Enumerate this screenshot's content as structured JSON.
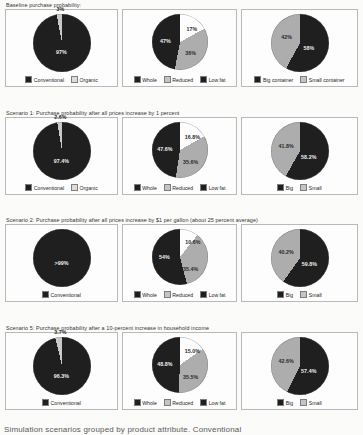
{
  "document": {
    "footer_partial_text": "Simulation scenarios grouped by product attribute. Conventional"
  },
  "palette": {
    "dark": "#1f1f1f",
    "light": "#adadad",
    "mid": "#3a3a3a",
    "panel_border": "#b9b9b9",
    "page_background": "#fbfbfa"
  },
  "sections": [
    {
      "id": "baseline",
      "title": "Baseline purchase probability:",
      "charts": [
        {
          "name": "organic-vs-conventional",
          "type": "pie",
          "size": 58,
          "slices": [
            {
              "label": "Conventional",
              "value": 97,
              "display": "97%",
              "color": "#1f1f1f",
              "label_pos": "inside",
              "label_x": 50,
              "label_y": 66,
              "label_tone": "on-dark"
            },
            {
              "label": "Organic",
              "value": 3,
              "display": "3%",
              "color": "#c9c9c9",
              "label_pos": "outside",
              "label_x": 48,
              "label_y": -9,
              "label_tone": "outside"
            }
          ],
          "legend": [
            {
              "label": "Conventional",
              "color": "#1f1f1f"
            },
            {
              "label": "Organic",
              "color": "#dcdcdc"
            }
          ]
        },
        {
          "name": "milk-fat-level",
          "type": "pie",
          "size": 56,
          "slices": [
            {
              "label": "Low fat",
              "value": 17,
              "display": "17%",
              "color": "#fdfdfd",
              "label_pos": "inside",
              "label_x": 72,
              "label_y": 26,
              "label_tone": "on-light"
            },
            {
              "label": "Reduced",
              "value": 36,
              "display": "36%",
              "color": "#adadad",
              "label_pos": "inside",
              "label_x": 70,
              "label_y": 70,
              "label_tone": "on-light"
            },
            {
              "label": "Whole",
              "value": 47,
              "display": "47%",
              "color": "#1f1f1f",
              "label_pos": "inside",
              "label_x": 25,
              "label_y": 48,
              "label_tone": "on-dark"
            }
          ],
          "legend": [
            {
              "label": "Whole",
              "color": "#1f1f1f"
            },
            {
              "label": "Reduced",
              "color": "#c4c4c4"
            },
            {
              "label": "Low fat",
              "color": "#1f1f1f"
            }
          ]
        },
        {
          "name": "container-size",
          "type": "pie",
          "size": 58,
          "slices": [
            {
              "label": "Big container",
              "value": 58,
              "display": "58%",
              "color": "#1f1f1f",
              "label_pos": "inside",
              "label_x": 66,
              "label_y": 58,
              "label_tone": "on-dark"
            },
            {
              "label": "Small container",
              "value": 42,
              "display": "42%",
              "color": "#adadad",
              "label_pos": "inside",
              "label_x": 28,
              "label_y": 40,
              "label_tone": "on-light"
            }
          ],
          "legend": [
            {
              "label": "Big container",
              "color": "#1f1f1f"
            },
            {
              "label": "Small container",
              "color": "#c4c4c4"
            }
          ]
        }
      ]
    },
    {
      "id": "scenario-1",
      "title": "Scenario 1: Purchase probability after all prices increase by 1 percent",
      "charts": [
        {
          "name": "organic-vs-conventional",
          "type": "pie",
          "size": 58,
          "slices": [
            {
              "label": "Conventional",
              "value": 97.4,
              "display": "97.4%",
              "color": "#1f1f1f",
              "label_pos": "inside",
              "label_x": 50,
              "label_y": 68,
              "label_tone": "on-dark"
            },
            {
              "label": "Organic",
              "value": 2.6,
              "display": "2.6%",
              "color": "#c9c9c9",
              "label_pos": "outside",
              "label_x": 48,
              "label_y": -9,
              "label_tone": "outside"
            }
          ],
          "legend": [
            {
              "label": "Conventional",
              "color": "#1f1f1f"
            },
            {
              "label": "Organic",
              "color": "#dcdcdc"
            }
          ]
        },
        {
          "name": "milk-fat-level",
          "type": "pie",
          "size": 56,
          "slices": [
            {
              "label": "Low fat",
              "value": 16.8,
              "display": "16.8%",
              "color": "#fdfdfd",
              "label_pos": "inside",
              "label_x": 73,
              "label_y": 27,
              "label_tone": "on-light"
            },
            {
              "label": "Reduced",
              "value": 35.6,
              "display": "35.6%",
              "color": "#adadad",
              "label_pos": "inside",
              "label_x": 70,
              "label_y": 71,
              "label_tone": "on-light"
            },
            {
              "label": "Whole",
              "value": 47.6,
              "display": "47.6%",
              "color": "#1f1f1f",
              "label_pos": "inside",
              "label_x": 24,
              "label_y": 49,
              "label_tone": "on-dark"
            }
          ],
          "legend": [
            {
              "label": "Whole",
              "color": "#1f1f1f"
            },
            {
              "label": "Reduced",
              "color": "#c4c4c4"
            },
            {
              "label": "Low fat",
              "color": "#1f1f1f"
            }
          ]
        },
        {
          "name": "container-size",
          "type": "pie",
          "size": 58,
          "slices": [
            {
              "label": "Big",
              "value": 58.2,
              "display": "58.2%",
              "color": "#1f1f1f",
              "label_pos": "inside",
              "label_x": 66,
              "label_y": 60,
              "label_tone": "on-dark"
            },
            {
              "label": "Small",
              "value": 41.8,
              "display": "41.8%",
              "color": "#adadad",
              "label_pos": "inside",
              "label_x": 27,
              "label_y": 41,
              "label_tone": "on-light"
            }
          ],
          "legend": [
            {
              "label": "Big",
              "color": "#1f1f1f"
            },
            {
              "label": "Small",
              "color": "#c4c4c4"
            }
          ]
        }
      ]
    },
    {
      "id": "scenario-2",
      "title": "Scenario 2: Purchase probability after all prices increase by $1 per gallon (about 25 percent average)",
      "charts": [
        {
          "name": "organic-vs-conventional",
          "type": "pie",
          "size": 58,
          "slices": [
            {
              "label": "Conventional",
              "value": 99.6,
              "display": ">99%",
              "color": "#1f1f1f",
              "label_pos": "inside",
              "label_x": 50,
              "label_y": 58,
              "label_tone": "on-dark"
            }
          ],
          "legend": [
            {
              "label": "Conventional",
              "color": "#1f1f1f"
            }
          ]
        },
        {
          "name": "milk-fat-level",
          "type": "pie",
          "size": 56,
          "slices": [
            {
              "label": "Low fat",
              "value": 10.6,
              "display": "10.6%",
              "color": "#fdfdfd",
              "label_pos": "inside",
              "label_x": 74,
              "label_y": 24,
              "label_tone": "on-light"
            },
            {
              "label": "Reduced",
              "value": 35.4,
              "display": "35.4%",
              "color": "#adadad",
              "label_pos": "inside",
              "label_x": 70,
              "label_y": 72,
              "label_tone": "on-light"
            },
            {
              "label": "Whole",
              "value": 54.0,
              "display": "54%",
              "color": "#1f1f1f",
              "label_pos": "inside",
              "label_x": 23,
              "label_y": 50,
              "label_tone": "on-dark"
            }
          ],
          "legend": [
            {
              "label": "Whole",
              "color": "#1f1f1f"
            },
            {
              "label": "Reduced",
              "color": "#c4c4c4"
            },
            {
              "label": "Low fat",
              "color": "#1f1f1f"
            }
          ]
        },
        {
          "name": "container-size",
          "type": "pie",
          "size": 58,
          "slices": [
            {
              "label": "Big",
              "value": 59.8,
              "display": "59.8%",
              "color": "#1f1f1f",
              "label_pos": "inside",
              "label_x": 67,
              "label_y": 61,
              "label_tone": "on-dark"
            },
            {
              "label": "Small",
              "value": 40.2,
              "display": "40.2%",
              "color": "#adadad",
              "label_pos": "inside",
              "label_x": 27,
              "label_y": 40,
              "label_tone": "on-light"
            }
          ],
          "legend": [
            {
              "label": "Big",
              "color": "#1f1f1f"
            },
            {
              "label": "Small",
              "color": "#c4c4c4"
            }
          ]
        }
      ]
    },
    {
      "id": "scenario-5",
      "title": "Scenario 5: Purchase probability after a 10-percent increase in household income",
      "charts": [
        {
          "name": "organic-vs-conventional",
          "type": "pie",
          "size": 58,
          "slices": [
            {
              "label": "Conventional",
              "value": 96.3,
              "display": "96.3%",
              "color": "#1f1f1f",
              "label_pos": "inside",
              "label_x": 50,
              "label_y": 68,
              "label_tone": "on-dark"
            },
            {
              "label": "Organic",
              "value": 3.7,
              "display": "3.7%",
              "color": "#c9c9c9",
              "label_pos": "outside",
              "label_x": 48,
              "label_y": -9,
              "label_tone": "outside"
            }
          ],
          "legend": [
            {
              "label": "Conventional",
              "color": "#1f1f1f"
            }
          ]
        },
        {
          "name": "milk-fat-level",
          "type": "pie",
          "size": 56,
          "slices": [
            {
              "label": "Low fat",
              "value": 15.0,
              "display": "15.0%",
              "color": "#fdfdfd",
              "label_pos": "inside",
              "label_x": 73,
              "label_y": 25,
              "label_tone": "on-light"
            },
            {
              "label": "Reduced",
              "value": 35.5,
              "display": "35.5%",
              "color": "#adadad",
              "label_pos": "inside",
              "label_x": 70,
              "label_y": 71,
              "label_tone": "on-light"
            },
            {
              "label": "Whole",
              "value": 48.8,
              "display": "48.8%",
              "color": "#1f1f1f",
              "label_pos": "inside",
              "label_x": 24,
              "label_y": 49,
              "label_tone": "on-dark"
            }
          ],
          "legend": [
            {
              "label": "Whole",
              "color": "#1f1f1f"
            },
            {
              "label": "Reduced",
              "color": "#c4c4c4"
            },
            {
              "label": "Low fat",
              "color": "#1f1f1f"
            }
          ]
        },
        {
          "name": "container-size",
          "type": "pie",
          "size": 58,
          "slices": [
            {
              "label": "Big",
              "value": 57.4,
              "display": "57.4%",
              "color": "#1f1f1f",
              "label_pos": "inside",
              "label_x": 66,
              "label_y": 59,
              "label_tone": "on-dark"
            },
            {
              "label": "Small",
              "value": 42.6,
              "display": "42.6%",
              "color": "#adadad",
              "label_pos": "inside",
              "label_x": 27,
              "label_y": 41,
              "label_tone": "on-light"
            }
          ],
          "legend": [
            {
              "label": "Big",
              "color": "#1f1f1f"
            },
            {
              "label": "Small",
              "color": "#c4c4c4"
            }
          ]
        }
      ]
    }
  ],
  "chart_data": [
    {
      "type": "pie",
      "title": "Baseline purchase probability: organic vs conventional",
      "categories": [
        "Conventional",
        "Organic"
      ],
      "values": [
        97,
        3
      ],
      "labels": [
        "97%",
        "3%"
      ],
      "legend_position": "bottom"
    },
    {
      "type": "pie",
      "title": "Baseline purchase probability: milk fat level",
      "categories": [
        "Whole",
        "Reduced",
        "Low fat"
      ],
      "values": [
        47,
        36,
        17
      ],
      "labels": [
        "47%",
        "36%",
        "17%"
      ],
      "legend_position": "bottom"
    },
    {
      "type": "pie",
      "title": "Baseline purchase probability: container size",
      "categories": [
        "Big container",
        "Small container"
      ],
      "values": [
        58,
        42
      ],
      "labels": [
        "58%",
        "42%"
      ],
      "legend_position": "bottom"
    },
    {
      "type": "pie",
      "title": "Scenario 1: organic vs conventional",
      "categories": [
        "Conventional",
        "Organic"
      ],
      "values": [
        97.4,
        2.6
      ],
      "labels": [
        "97.4%",
        "2.6%"
      ],
      "legend_position": "bottom"
    },
    {
      "type": "pie",
      "title": "Scenario 1: milk fat level",
      "categories": [
        "Whole",
        "Reduced",
        "Low fat"
      ],
      "values": [
        47.6,
        35.6,
        16.8
      ],
      "labels": [
        "47.6%",
        "35.6%",
        "16.8%"
      ],
      "legend_position": "bottom"
    },
    {
      "type": "pie",
      "title": "Scenario 1: container size",
      "categories": [
        "Big",
        "Small"
      ],
      "values": [
        58.2,
        41.8
      ],
      "labels": [
        "58.2%",
        "41.8%"
      ],
      "legend_position": "bottom"
    },
    {
      "type": "pie",
      "title": "Scenario 2: organic vs conventional",
      "categories": [
        "Conventional"
      ],
      "values": [
        100
      ],
      "labels": [
        ">99%"
      ],
      "legend_position": "bottom"
    },
    {
      "type": "pie",
      "title": "Scenario 2: milk fat level",
      "categories": [
        "Whole",
        "Reduced",
        "Low fat"
      ],
      "values": [
        54.0,
        35.4,
        10.6
      ],
      "labels": [
        "54%",
        "35.4%",
        "10.6%"
      ],
      "legend_position": "bottom"
    },
    {
      "type": "pie",
      "title": "Scenario 2: container size",
      "categories": [
        "Big",
        "Small"
      ],
      "values": [
        59.8,
        40.2
      ],
      "labels": [
        "59.8%",
        "40.2%"
      ],
      "legend_position": "bottom"
    },
    {
      "type": "pie",
      "title": "Scenario 5: organic vs conventional",
      "categories": [
        "Conventional",
        "Organic"
      ],
      "values": [
        96.3,
        3.7
      ],
      "labels": [
        "96.3%",
        "3.7%"
      ],
      "legend_position": "bottom"
    },
    {
      "type": "pie",
      "title": "Scenario 5: milk fat level",
      "categories": [
        "Whole",
        "Reduced",
        "Low fat"
      ],
      "values": [
        48.8,
        35.5,
        15.0
      ],
      "labels": [
        "48.8%",
        "35.5%",
        "15.0%"
      ],
      "legend_position": "bottom"
    },
    {
      "type": "pie",
      "title": "Scenario 5: container size",
      "categories": [
        "Big",
        "Small"
      ],
      "values": [
        57.4,
        42.6
      ],
      "labels": [
        "57.4%",
        "42.6%"
      ],
      "legend_position": "bottom"
    }
  ]
}
